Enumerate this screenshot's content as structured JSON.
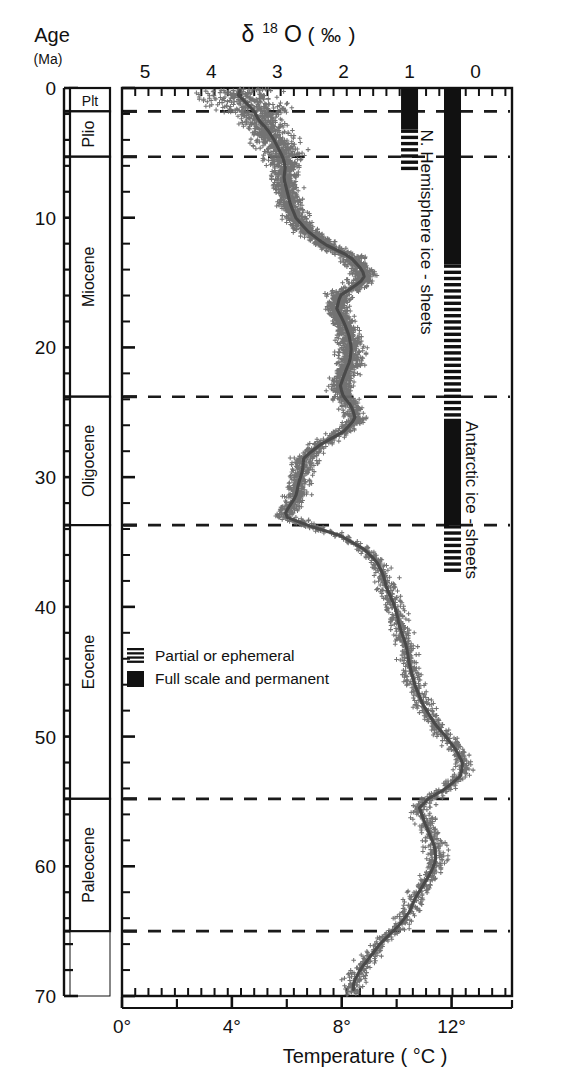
{
  "figure": {
    "title_top": "δ 18 O ( ‰ )",
    "title_bottom": "Temperature ( °C )",
    "age_label_line1": "Age",
    "age_label_line2": "(Ma)"
  },
  "axes": {
    "d18o": {
      "label": "δ 18 O ( ‰ )",
      "ticks": [
        "5",
        "4",
        "3",
        "2",
        "1",
        "0"
      ],
      "values": [
        5,
        4,
        3,
        2,
        1,
        0
      ],
      "min": 5.35,
      "max": -0.55,
      "minor_step": 0.2
    },
    "age": {
      "label": "Age",
      "unit": "(Ma)",
      "ticks": [
        "0",
        "10",
        "20",
        "30",
        "40",
        "50",
        "60",
        "70"
      ],
      "values": [
        0,
        10,
        20,
        30,
        40,
        50,
        60,
        70
      ],
      "min": 0,
      "max": 70,
      "minor_step": 2
    },
    "temperature": {
      "label": "Temperature ( °C )",
      "ticks": [
        "0°",
        "4°",
        "8°",
        "12°"
      ],
      "values": [
        0,
        4,
        8,
        12
      ],
      "minor_values": [
        2,
        6,
        10
      ],
      "min": 0,
      "max": 14.2
    }
  },
  "epochs": [
    {
      "name": "Plt",
      "top": 0.0,
      "bottom": 1.8
    },
    {
      "name": "Plio",
      "top": 1.8,
      "bottom": 5.3
    },
    {
      "name": "Miocene",
      "top": 5.3,
      "bottom": 23.8
    },
    {
      "name": "Oligocene",
      "top": 23.8,
      "bottom": 33.7
    },
    {
      "name": "Eocene",
      "top": 33.7,
      "bottom": 54.8
    },
    {
      "name": "Paleocene",
      "top": 54.8,
      "bottom": 65.0
    }
  ],
  "boundaries_ma": [
    1.8,
    5.3,
    23.8,
    33.7,
    54.8,
    65.0
  ],
  "ice_bars": [
    {
      "name": "N. Hemisphere ice - sheets",
      "label": "N. Hemisphere ice - sheets",
      "d18o_center": 1.0,
      "segments": [
        {
          "from": 0.0,
          "to": 3.2,
          "style": "full"
        },
        {
          "from": 3.2,
          "to": 6.4,
          "style": "partial"
        }
      ]
    },
    {
      "name": "Antarctic ice - sheets",
      "label": "Antarctic ice - sheets",
      "d18o_center": 0.35,
      "segments": [
        {
          "from": 0.0,
          "to": 13.6,
          "style": "full"
        },
        {
          "from": 13.6,
          "to": 25.5,
          "style": "partial"
        },
        {
          "from": 25.5,
          "to": 33.7,
          "style": "full"
        },
        {
          "from": 33.7,
          "to": 37.5,
          "style": "partial"
        }
      ]
    }
  ],
  "legend": {
    "items": [
      {
        "swatch": "partial",
        "label": "Partial or ephemeral"
      },
      {
        "swatch": "full",
        "label": "Full scale and permanent"
      }
    ]
  },
  "colors": {
    "ink": "#111111",
    "data": "#6b6b6b",
    "curve": "#4a4a4a",
    "dashed": "#1a1a1a",
    "background": "#ffffff"
  },
  "chart_data": {
    "type": "scatter",
    "xlabel": "δ 18 O ( ‰ )",
    "ylabel": "Age (Ma)",
    "x2label": "Temperature ( °C )",
    "xlim": [
      5.35,
      -0.55
    ],
    "ylim": [
      70,
      0
    ],
    "grid": false,
    "legend_position": "center-left",
    "note": "Cenozoic benthic foraminiferal δ18O stack (Zachos et al.). Dense + markers are individual samples; heavy line is the smoothed 5-point running mean.",
    "series": [
      {
        "name": "Smoothed δ18O curve",
        "marker": "line",
        "age_ma": [
          0.0,
          0.5,
          1.0,
          1.8,
          2.5,
          3.2,
          4.0,
          5.0,
          5.3,
          6.0,
          7.0,
          8.0,
          9.0,
          10.0,
          11.0,
          12.0,
          13.0,
          14.0,
          14.5,
          15.0,
          15.5,
          16.0,
          17.0,
          18.0,
          19.0,
          20.0,
          21.0,
          22.0,
          23.0,
          23.8,
          24.5,
          25.5,
          26.5,
          27.5,
          28.5,
          29.5,
          30.5,
          31.5,
          32.5,
          33.0,
          33.7,
          34.5,
          35.5,
          36.5,
          37.5,
          38.5,
          40.0,
          41.5,
          43.0,
          44.5,
          46.0,
          47.5,
          49.0,
          50.0,
          51.0,
          52.0,
          53.0,
          54.0,
          54.8,
          55.5,
          56.5,
          57.5,
          58.5,
          59.5,
          60.5,
          61.5,
          62.5,
          63.5,
          64.5,
          65.0,
          66.0,
          67.0,
          68.0,
          69.0
        ],
        "d18o": [
          3.55,
          3.6,
          3.5,
          3.35,
          3.28,
          3.15,
          3.05,
          2.95,
          2.92,
          2.88,
          2.9,
          2.85,
          2.8,
          2.72,
          2.55,
          2.3,
          1.9,
          1.72,
          1.68,
          1.75,
          1.9,
          2.05,
          2.1,
          2.0,
          1.92,
          1.88,
          1.9,
          1.98,
          2.05,
          2.0,
          1.88,
          1.82,
          2.0,
          2.35,
          2.6,
          2.62,
          2.68,
          2.72,
          2.85,
          2.9,
          2.55,
          2.05,
          1.7,
          1.5,
          1.4,
          1.35,
          1.22,
          1.15,
          1.05,
          1.0,
          0.92,
          0.8,
          0.62,
          0.45,
          0.3,
          0.2,
          0.22,
          0.45,
          0.72,
          0.85,
          0.78,
          0.7,
          0.62,
          0.6,
          0.68,
          0.8,
          0.92,
          1.0,
          1.15,
          1.25,
          1.45,
          1.6,
          1.75,
          1.85
        ]
      }
    ]
  }
}
